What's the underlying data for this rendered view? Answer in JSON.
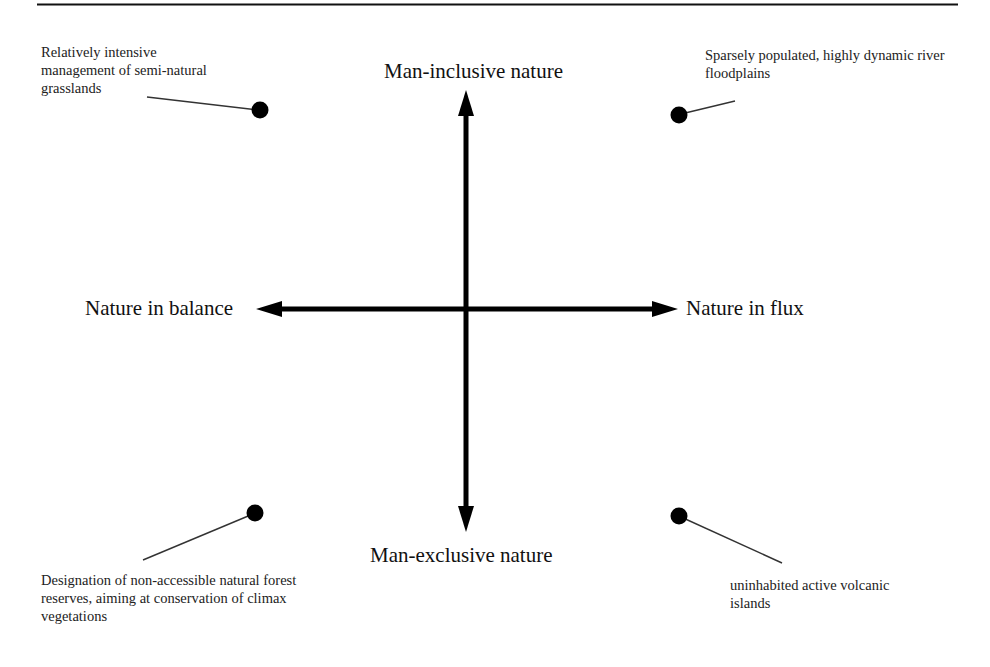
{
  "diagram": {
    "axes": {
      "top": "Man-inclusive nature",
      "bottom": "Man-exclusive nature",
      "left": "Nature in balance",
      "right": "Nature in flux"
    },
    "quadrant_notes": {
      "top_left": {
        "lines": [
          "Relatively intensive",
          "management of semi-natural",
          "grasslands"
        ]
      },
      "top_right": {
        "lines": [
          "Sparsely populated, highly dynamic river",
          "floodplains"
        ]
      },
      "bottom_left": {
        "lines": [
          "Designation of non-accessible natural forest",
          "reserves, aiming at conservation of climax",
          "vegetations"
        ]
      },
      "bottom_right": {
        "lines": [
          "uninhabited active volcanic",
          "islands"
        ]
      }
    },
    "colors": {
      "ink": "#111111",
      "leader": "#333333",
      "background": "#ffffff"
    }
  }
}
